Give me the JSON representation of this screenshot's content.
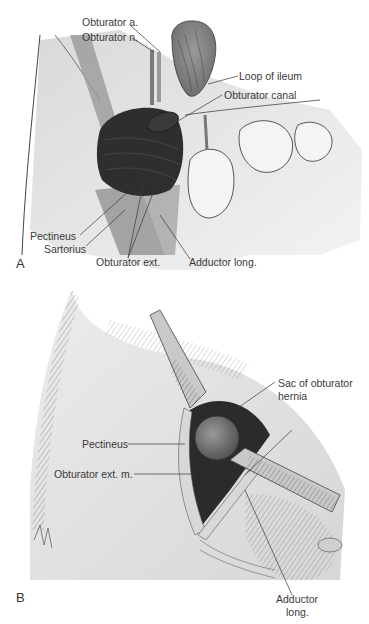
{
  "figure": {
    "panels": [
      {
        "letter": "A",
        "labels": {
          "obturator_a": "Obturator a.",
          "obturator_n": "Obturator n.",
          "loop_of_ileum": "Loop of ileum",
          "obturator_canal": "Obturator canal",
          "pectineus": "Pectineus",
          "sartorius": "Sartorius",
          "obturator_ext": "Obturator ext.",
          "adductor_long": "Adductor long."
        }
      },
      {
        "letter": "B",
        "labels": {
          "sac_line1": "Sac of obturator",
          "sac_line2": "hernia",
          "pectineus": "Pectineus",
          "obturator_ext_m": "Obturator ext. m.",
          "adductor_line1": "Adductor",
          "adductor_line2": "long."
        }
      }
    ],
    "colors": {
      "background": "#ffffff",
      "skin": "#e6e6e6",
      "shade": "#bdbdbd",
      "muscle_dark": "#2a2a2a",
      "muscle_mid": "#8a8a8a",
      "line": "#3a3a3a"
    }
  }
}
